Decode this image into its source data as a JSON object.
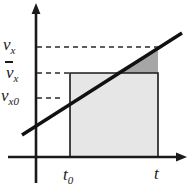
{
  "figure": {
    "name": "velocity-time-graph",
    "background_color": "#ffffff"
  },
  "axes": {
    "y_axis": {
      "name": "velocity-axis",
      "color": "#1a1a1a",
      "x": 36,
      "top": 5,
      "bottom": 183,
      "arrow": "up"
    },
    "x_axis": {
      "name": "time-axis",
      "color": "#1a1a1a",
      "y": 157,
      "left": 8,
      "right": 186,
      "arrow": "right"
    }
  },
  "labels": {
    "v_x": {
      "symbol": "v",
      "subscript": "x",
      "overbar": false,
      "text": "v_x"
    },
    "v_bar_x": {
      "symbol": "v",
      "subscript": "x",
      "overbar": true,
      "text": "v̄_x"
    },
    "v_x0": {
      "symbol": "v",
      "subscript": "x0",
      "overbar": false,
      "text": "v_x0"
    },
    "t_0": {
      "symbol": "t",
      "subscript": "0",
      "text": "t_0"
    },
    "t": {
      "symbol": "t",
      "subscript": "",
      "text": "t"
    }
  },
  "chart_data": {
    "type": "line",
    "title": "",
    "xlabel": "t",
    "ylabel": "v_x",
    "grid": false,
    "legend": null,
    "series": [
      {
        "name": "velocity-line",
        "style": "solid-thick",
        "color": "#111111",
        "points": [
          {
            "x": 22,
            "y": 135
          },
          {
            "x": 182,
            "y": 33
          }
        ],
        "description": "Straight velocity line with constant positive slope (constant acceleration)"
      }
    ],
    "markers": {
      "t_0": {
        "pixel_x": 70,
        "label": "t_0"
      },
      "t": {
        "pixel_x": 158,
        "label": "t"
      },
      "v_x0": {
        "pixel_y": 98,
        "label": "v_x0",
        "description": "velocity-line intercept at y-axis"
      },
      "v_bar_x": {
        "pixel_y": 73,
        "label": "v̄_x",
        "description": "average velocity, top of light rectangle"
      },
      "v_x": {
        "pixel_y": 47,
        "label": "v_x",
        "description": "final velocity at time t"
      }
    },
    "dashed_lines": [
      {
        "name": "vx-dashed",
        "y": 47,
        "x_from": 37,
        "x_to": 158,
        "color": "#2a2a2a"
      },
      {
        "name": "vbarx-dashed",
        "y": 73,
        "x_from": 37,
        "x_to": 70,
        "color": "#2a2a2a"
      },
      {
        "name": "vx0-dashed",
        "y": 98,
        "x_from": 37,
        "x_to": 63,
        "color": "#2a2a2a"
      }
    ],
    "shaded_regions": [
      {
        "name": "average-velocity-rectangle",
        "shape": "rect",
        "fill": "#e6e6e6",
        "stroke": "#1a1a1a",
        "x_from": 70,
        "x_to": 158,
        "y_top": 73,
        "y_bottom": 157,
        "description": "Rectangle of width (t - t0) and height v-bar-x representing displacement"
      },
      {
        "name": "excess-area-triangle",
        "shape": "triangle",
        "fill": "#a6a6a6",
        "stroke": "none",
        "vertices": [
          [
            115,
            73
          ],
          [
            158,
            73
          ],
          [
            158,
            47
          ]
        ],
        "description": "Darker triangle between the average velocity level and the velocity line"
      }
    ]
  }
}
